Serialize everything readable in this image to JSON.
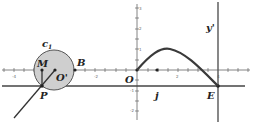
{
  "diagram": {
    "labels": {
      "c1": "c",
      "c1_sub": "1",
      "M": "M",
      "O_prime": "O'",
      "B": "B",
      "P": "P",
      "O": "O",
      "j": "j",
      "E": "E",
      "y_prime": "y'"
    },
    "x_tick_labels": [
      "-4",
      "-2",
      "2",
      "4"
    ],
    "y_tick_labels": [
      "3",
      "2",
      "1",
      "-1",
      "-2"
    ],
    "colors": {
      "axis": "#555555",
      "thick_line": "#444444",
      "curve": "#3a3a3a",
      "circle_fill": "#cfcfcf",
      "circle_stroke": "#555555"
    }
  }
}
